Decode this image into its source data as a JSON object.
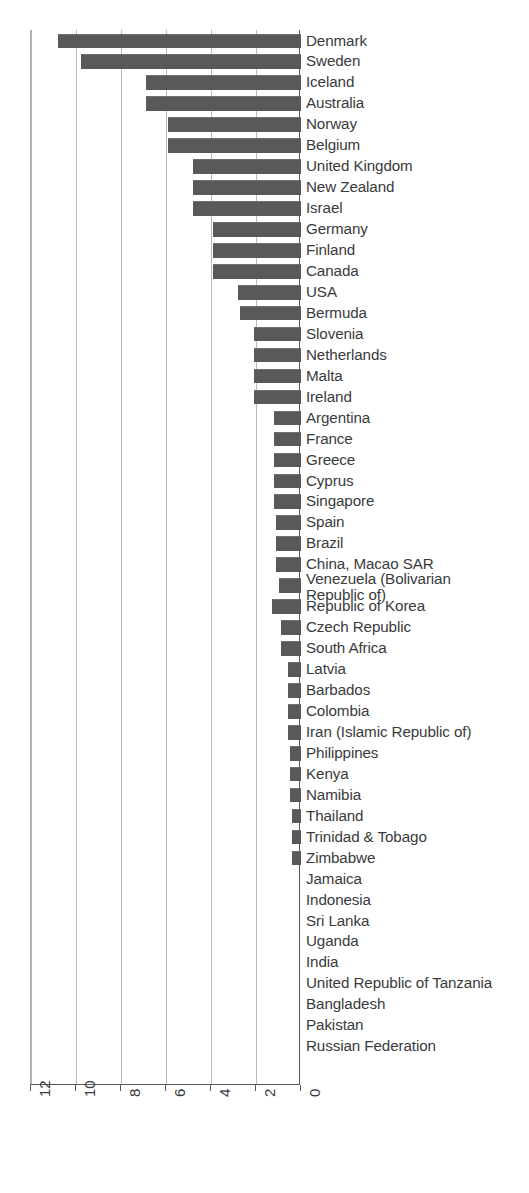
{
  "chart_data": {
    "type": "bar",
    "orientation": "horizontal",
    "title": "",
    "subtitle": "",
    "xlabel": "",
    "ylabel": "",
    "xlim": [
      12,
      0
    ],
    "x_axis_reversed": true,
    "xticks": [
      12,
      10,
      8,
      6,
      4,
      2,
      0
    ],
    "xtick_labels": [
      "12",
      "10",
      "8",
      "6",
      "4",
      "2",
      "0"
    ],
    "grid": "vertical",
    "legend": "none",
    "bar_color": "#595959",
    "gridline_color": "#b9b9b9",
    "axis_color": "#58585a",
    "categories": [
      "Denmark",
      "Sweden",
      "Iceland",
      "Australia",
      "Norway",
      "Belgium",
      "United Kingdom",
      "New Zealand",
      "Israel",
      "Germany",
      "Finland",
      "Canada",
      "USA",
      "Bermuda",
      "Slovenia",
      "Netherlands",
      "Malta",
      "Ireland",
      "Argentina",
      "France",
      "Greece",
      "Cyprus",
      "Singapore",
      "Spain",
      "Brazil",
      "China, Macao SAR",
      "Venezuela (Bolivarian\nRepublic of)",
      "Republic of Korea",
      "Czech Republic",
      "South Africa",
      "Latvia",
      "Barbados",
      "Colombia",
      "Iran (Islamic Republic of)",
      "Philippines",
      "Kenya",
      "Namibia",
      "Thailand",
      "Trinidad & Tobago",
      "Zimbabwe",
      "Jamaica",
      "Indonesia",
      "Sri Lanka",
      "Uganda",
      "India",
      "United Republic of Tanzania",
      "Bangladesh",
      "Pakistan",
      "Russian Federation"
    ],
    "values": [
      10.8,
      9.8,
      6.9,
      6.9,
      5.9,
      5.9,
      4.8,
      4.8,
      4.8,
      3.9,
      3.9,
      3.9,
      2.8,
      2.7,
      2.1,
      2.1,
      2.1,
      2.1,
      1.2,
      1.2,
      1.2,
      1.2,
      1.2,
      1.1,
      1.1,
      1.1,
      1.0,
      1.3,
      0.9,
      0.9,
      0.6,
      0.6,
      0.6,
      0.6,
      0.5,
      0.5,
      0.5,
      0.4,
      0.4,
      0.4,
      0.0,
      0.0,
      0.0,
      0.0,
      0.0,
      0.0,
      0.0,
      0.0,
      0.0
    ]
  }
}
